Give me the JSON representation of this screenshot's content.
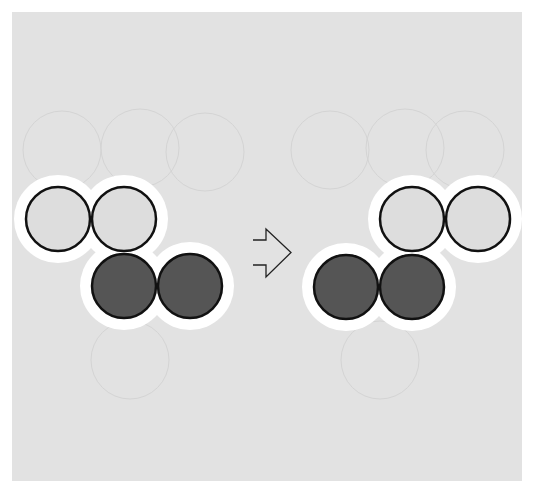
{
  "diagram": {
    "type": "transformation",
    "colors": {
      "page_background": "#ffffff",
      "panel_background": "#e2e2e2",
      "halo": "#ffffff",
      "light_fill": "#dddddd",
      "dark_fill": "#555555",
      "stroke": "#111111",
      "ghost": "#d4d4d4"
    },
    "circle_radius": 33,
    "halo_width": 11,
    "left_shape": {
      "label": "before",
      "circles": [
        {
          "cx": 58,
          "cy": 219,
          "tone": "light"
        },
        {
          "cx": 124,
          "cy": 219,
          "tone": "light"
        },
        {
          "cx": 124,
          "cy": 286,
          "tone": "dark"
        },
        {
          "cx": 190,
          "cy": 286,
          "tone": "dark"
        }
      ]
    },
    "arrow": {
      "label": "becomes",
      "direction": "right",
      "style": "outline"
    },
    "right_shape": {
      "label": "after",
      "circles": [
        {
          "cx": 412,
          "cy": 219,
          "tone": "light"
        },
        {
          "cx": 478,
          "cy": 219,
          "tone": "light"
        },
        {
          "cx": 346,
          "cy": 287,
          "tone": "dark"
        },
        {
          "cx": 412,
          "cy": 287,
          "tone": "dark"
        }
      ]
    },
    "ghost_circles": [
      {
        "cx": 62,
        "cy": 150
      },
      {
        "cx": 140,
        "cy": 148
      },
      {
        "cx": 205,
        "cy": 152
      },
      {
        "cx": 330,
        "cy": 150
      },
      {
        "cx": 405,
        "cy": 148
      },
      {
        "cx": 465,
        "cy": 150
      },
      {
        "cx": 130,
        "cy": 360
      },
      {
        "cx": 380,
        "cy": 360
      }
    ]
  }
}
